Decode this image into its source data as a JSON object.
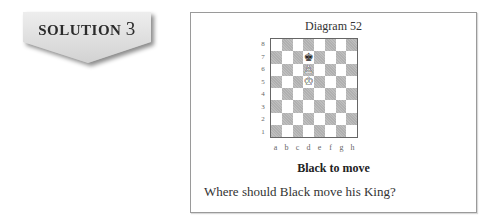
{
  "banner": {
    "label": "SOLUTION",
    "number": "3",
    "fill_color": "#dcdcdc"
  },
  "diagram": {
    "title": "Diagram 52",
    "ranks": [
      "8",
      "7",
      "6",
      "5",
      "4",
      "3",
      "2",
      "1"
    ],
    "files": [
      "a",
      "b",
      "c",
      "d",
      "e",
      "f",
      "g",
      "h"
    ],
    "square_colors": {
      "light": "#ffffff",
      "dark": "#b0b0b0"
    },
    "pieces": [
      {
        "square": "d7",
        "color": "black",
        "type": "king",
        "glyph": "♚"
      },
      {
        "square": "d6",
        "color": "white",
        "type": "pawn",
        "glyph": "♙"
      },
      {
        "square": "d5",
        "color": "white",
        "type": "king",
        "glyph": "♔"
      }
    ],
    "caption": "Black to move",
    "question": "Where should Black move his King?"
  }
}
